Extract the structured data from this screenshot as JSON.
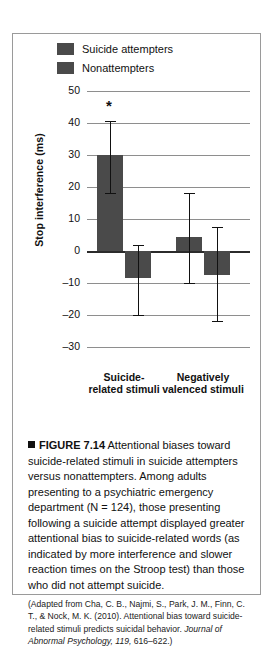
{
  "figure": {
    "marker_icon": "black-square-icon",
    "number": "FIGURE 7.14",
    "caption": "Attentional biases toward suicide-related stimuli in suicide attempters versus nonattempters. Among adults presenting to a psychiatric emergency department (N = 124), those presenting following a suicide attempt displayed greater attentional bias to suicide-related words (as indicated by more interference and slower reaction times on the Stroop test) than those who did not attempt suicide.",
    "source_prefix": "(Adapted from Cha, C. B., Najmi, S., Park, J. M., Finn, C. T., & Nock, M. K. (2010). Attentional bias toward suicide-related stimuli predicts suicidal behavior. ",
    "source_journal": "Journal of Abnormal Psychology, 119,",
    "source_pages": " 616–622.)"
  },
  "chart_data": {
    "type": "bar",
    "title": "",
    "xlabel": "",
    "ylabel": "Stop interference (ms)",
    "categories": [
      "Suicide-related stimuli",
      "Negatively valenced stimuli"
    ],
    "category_lines": [
      [
        "Suicide-",
        "related stimuli"
      ],
      [
        "Negatively",
        "valenced stimuli"
      ]
    ],
    "series": [
      {
        "name": "Suicide attempters",
        "color": "#4a4a4a",
        "values": [
          30,
          4.5
        ],
        "error_low": [
          18,
          -10
        ],
        "error_high": [
          40.5,
          18
        ]
      },
      {
        "name": "Nonattempters",
        "color": "#4a4a4a",
        "values": [
          -8.5,
          -7.5
        ],
        "error_low": [
          -20,
          -22
        ],
        "error_high": [
          2,
          7.5
        ]
      }
    ],
    "ylim": [
      -30,
      50
    ],
    "yticks": [
      50,
      40,
      30,
      20,
      10,
      0,
      -10,
      -20,
      -30
    ],
    "ytick_labels": [
      "50",
      "40",
      "30",
      "20",
      "10",
      "0",
      "–10",
      "–20",
      "–30"
    ],
    "grid": true,
    "legend_position": "top-left",
    "annotations": [
      {
        "text": "*",
        "label": "significance-star",
        "x_category": 0,
        "series": 0,
        "y": 47
      }
    ]
  }
}
